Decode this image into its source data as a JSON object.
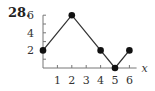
{
  "problem_label": "28.",
  "chart_data": {
    "type": "line",
    "title": "",
    "xlabel": "x",
    "ylabel": "",
    "x": [
      0,
      2,
      4,
      5,
      6
    ],
    "values": [
      2,
      6,
      2,
      0,
      2
    ],
    "series": [
      {
        "name": "f",
        "x": [
          0,
          2,
          4,
          5,
          6
        ],
        "values": [
          2,
          6,
          2,
          0,
          2
        ]
      }
    ],
    "x_ticks": [
      1,
      2,
      3,
      4,
      5,
      6
    ],
    "y_ticks": [
      2,
      4,
      6
    ],
    "y_minor_ticks": [
      1,
      2,
      3,
      4,
      5,
      6
    ],
    "xlim": [
      0,
      6.5
    ],
    "ylim": [
      0,
      6
    ],
    "markers": "filled-circle",
    "grid": false,
    "legend": "none",
    "colors": {
      "line": "#333333",
      "marker": "#111111",
      "axis": "#777777"
    }
  }
}
